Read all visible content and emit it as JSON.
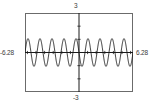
{
  "widget": {
    "name": "function-graph",
    "frame_color": "#6b6b6b",
    "background": "#ffffff",
    "curve_color": "#1a1a1a",
    "axis_color": "#1a1a1a",
    "label_color": "#3a3a3a"
  },
  "labels": {
    "y_max": "3",
    "y_min": "-3",
    "x_min": "-6.28",
    "x_max": "6.28"
  },
  "chart_data": {
    "type": "line",
    "title": "",
    "xlabel": "",
    "ylabel": "",
    "xlim": [
      -6.28,
      6.28
    ],
    "ylim": [
      -3,
      3
    ],
    "grid": false,
    "legend": "none",
    "axes": {
      "x_axis_at_y": 0,
      "y_axis_at_x": 0,
      "x_tick_spacing": 1,
      "y_tick_spacing": 1,
      "x_ticks": [
        -6,
        -5,
        -4,
        -3,
        -2,
        -1,
        1,
        2,
        3,
        4,
        5,
        6
      ],
      "y_ticks": [
        -2,
        -1,
        1,
        2
      ],
      "tick_labels_shown": false
    },
    "series": [
      {
        "name": "oscillation",
        "description": "sine-like oscillation, amplitude about 1, roughly 9 cycles across the domain",
        "amplitude": 1.05,
        "cycles": 9,
        "x": [
          -6.28,
          -6.11,
          -6.01,
          -5.84,
          -5.63,
          -5.46,
          -5.32,
          -5.15,
          -4.98,
          -4.8,
          -4.63,
          -4.49,
          -4.32,
          -4.15,
          -3.97,
          -3.8,
          -3.66,
          -3.49,
          -3.32,
          -3.14,
          -2.97,
          -2.83,
          -2.66,
          -2.49,
          -2.31,
          -2.14,
          -2.0,
          -1.83,
          -1.65,
          -1.48,
          -1.31,
          -1.17,
          -1.0,
          -0.82,
          -0.65,
          -0.48,
          -0.35,
          -0.17,
          0.0,
          0.17,
          0.35,
          0.48,
          0.65,
          0.82,
          1.0,
          1.17,
          1.31,
          1.48,
          1.65,
          1.83,
          2.0,
          2.14,
          2.31,
          2.49,
          2.66,
          2.83,
          2.97,
          3.14,
          3.32,
          3.49,
          3.66,
          3.8,
          3.97,
          4.15,
          4.32,
          4.49,
          4.63,
          4.8,
          4.98,
          5.15,
          5.32,
          5.46,
          5.63,
          5.84,
          6.01,
          6.11,
          6.28
        ],
        "y": [
          0.0,
          0.72,
          1.0,
          0.72,
          0.0,
          -0.72,
          -1.0,
          -0.72,
          0.0,
          0.72,
          1.0,
          0.72,
          0.0,
          -0.72,
          -1.0,
          -0.72,
          0.0,
          0.72,
          1.0,
          0.72,
          0.0,
          -0.72,
          -1.0,
          -0.72,
          0.0,
          0.72,
          1.0,
          0.72,
          0.0,
          -0.72,
          -1.0,
          -0.72,
          0.0,
          0.72,
          1.0,
          0.72,
          0.0,
          -0.72,
          -1.05,
          -0.72,
          0.0,
          0.72,
          1.0,
          0.72,
          0.0,
          -0.72,
          -1.0,
          -0.72,
          0.0,
          0.72,
          1.0,
          0.72,
          0.0,
          -0.72,
          -1.0,
          -0.72,
          0.0,
          0.72,
          1.0,
          0.72,
          0.0,
          -0.72,
          -1.0,
          -0.72,
          0.0,
          0.72,
          1.0,
          0.72,
          0.0,
          -0.72,
          -1.0,
          -0.72,
          0.0,
          0.72,
          1.0,
          0.72,
          0.0
        ]
      }
    ]
  }
}
